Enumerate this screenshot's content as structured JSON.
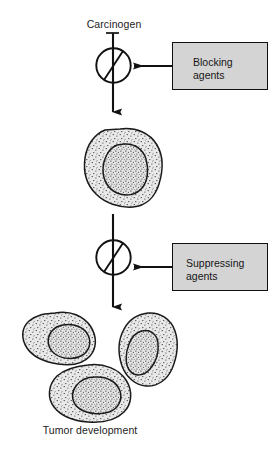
{
  "figure": {
    "type": "biological-pathway-diagram",
    "title_top": "Carcinogen",
    "title_bottom": "Tumor development",
    "background_color": "#ffffff",
    "ink_color": "#111111"
  },
  "labels": {
    "carcinogen": "Carcinogen",
    "tumor_development": "Tumor development"
  },
  "boxes": [
    {
      "id": "blocking",
      "text": "Blocking\nagents",
      "line1": "Blocking",
      "line2": "agents",
      "fill_color": "#d4d4d4",
      "border_color": "#111111"
    },
    {
      "id": "suppressing",
      "text": "Suppressing\nagents",
      "line1": "Suppressing",
      "line2": "agents",
      "fill_color": "#d4d4d4",
      "border_color": "#111111"
    }
  ],
  "symbols": [
    {
      "id": "inhibition-node-1",
      "name": "circle-with-slash",
      "stage": "blocking"
    },
    {
      "id": "inhibition-node-2",
      "name": "circle-with-slash",
      "stage": "suppressing"
    }
  ],
  "arrows": [
    {
      "id": "arrow-carcinogen-to-cell",
      "direction": "down"
    },
    {
      "id": "arrow-blocking-to-node",
      "direction": "left"
    },
    {
      "id": "arrow-cell-to-tumors",
      "direction": "down"
    },
    {
      "id": "arrow-suppressing-to-node",
      "direction": "left"
    }
  ],
  "cells": [
    {
      "id": "initiated-cell",
      "role": "single transformed cell",
      "nucleus": true
    },
    {
      "id": "tumor-cell-left",
      "role": "tumor cell",
      "nucleus": true
    },
    {
      "id": "tumor-cell-right",
      "role": "tumor cell",
      "nucleus": true
    },
    {
      "id": "tumor-cell-bottom",
      "role": "tumor cell",
      "nucleus": true
    }
  ]
}
